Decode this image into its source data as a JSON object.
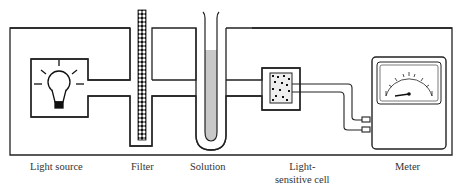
{
  "colors": {
    "stroke": "#222222",
    "solution_fill": "#c8c8c8",
    "background": "#ffffff"
  },
  "components": [
    {
      "id": "light-source",
      "label": "Light source",
      "icon": "light-bulb-icon"
    },
    {
      "id": "filter",
      "label": "Filter",
      "icon": "filter-pattern-icon"
    },
    {
      "id": "solution",
      "label": "Solution",
      "icon": "test-tube-icon"
    },
    {
      "id": "cell",
      "label_line1": "Light-",
      "label_line2": "sensitive cell",
      "icon": "photocell-icon"
    },
    {
      "id": "meter",
      "label": "Meter",
      "icon": "meter-gauge-icon"
    }
  ]
}
